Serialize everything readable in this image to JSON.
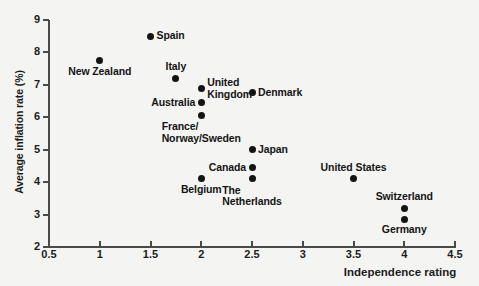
{
  "chart_data": {
    "type": "scatter",
    "title": "",
    "xlabel": "Independence rating",
    "ylabel": "Average inflation rate (%)",
    "xlim": [
      0.5,
      4.5
    ],
    "ylim": [
      2,
      9
    ],
    "xticks": [
      "0.5",
      "1",
      "1.5",
      "2",
      "2.5",
      "3",
      "3.5",
      "4",
      "4.5"
    ],
    "xtick_values": [
      0.5,
      1,
      1.5,
      2,
      2.5,
      3,
      3.5,
      4,
      4.5
    ],
    "yticks": [
      "9",
      "8",
      "7",
      "6",
      "5",
      "4",
      "3",
      "2"
    ],
    "ytick_values": [
      9,
      8,
      7,
      6,
      5,
      4,
      3,
      2
    ],
    "grid": false,
    "legend": null,
    "marker_color": "#141414",
    "axis_color": "#4a4a4a",
    "background_color": "#f4f4f2",
    "points": [
      {
        "name": "Spain",
        "x": 1.5,
        "y": 8.5,
        "label": "Spain",
        "label_pos": "right"
      },
      {
        "name": "New Zealand",
        "x": 1.0,
        "y": 7.75,
        "label": "New Zealand",
        "label_pos": "below-center"
      },
      {
        "name": "Italy",
        "x": 1.75,
        "y": 7.2,
        "label": "Italy",
        "label_pos": "above-center"
      },
      {
        "name": "United Kingdom",
        "x": 2.0,
        "y": 6.9,
        "label": "United\nKingdom",
        "label_pos": "right"
      },
      {
        "name": "Denmark",
        "x": 2.5,
        "y": 6.75,
        "label": "Denmark",
        "label_pos": "right"
      },
      {
        "name": "Australia",
        "x": 2.0,
        "y": 6.45,
        "label": "Australia",
        "label_pos": "left"
      },
      {
        "name": "France/Norway/Sweden",
        "x": 2.0,
        "y": 6.05,
        "label": "France/\nNorway/Sweden",
        "label_pos": "below-center"
      },
      {
        "name": "Japan",
        "x": 2.5,
        "y": 5.0,
        "label": "Japan",
        "label_pos": "right"
      },
      {
        "name": "Canada",
        "x": 2.5,
        "y": 4.45,
        "label": "Canada",
        "label_pos": "left"
      },
      {
        "name": "Belgium",
        "x": 2.0,
        "y": 4.1,
        "label": "Belgium",
        "label_pos": "below-center"
      },
      {
        "name": "The Netherlands",
        "x": 2.5,
        "y": 4.1,
        "label": "The\nNetherlands",
        "label_pos": "below-center"
      },
      {
        "name": "United States",
        "x": 3.5,
        "y": 4.1,
        "label": "United States",
        "label_pos": "above-center"
      },
      {
        "name": "Switzerland",
        "x": 4.0,
        "y": 3.2,
        "label": "Switzerland",
        "label_pos": "above-center"
      },
      {
        "name": "Germany",
        "x": 4.0,
        "y": 2.85,
        "label": "Germany",
        "label_pos": "below-center"
      }
    ]
  }
}
